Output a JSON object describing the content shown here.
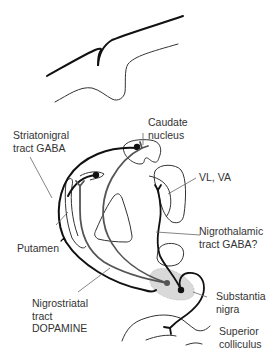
{
  "diagram": {
    "title": "",
    "colors": {
      "background": "#ffffff",
      "ink": "#111111",
      "outline": "#333333",
      "pointer": "#666666",
      "nigra_fill": "#d9d9d9",
      "label": "#333333"
    },
    "labels": {
      "caudate_line1": "Caudate",
      "caudate_line2": "nucleus",
      "striatonigral_line1": "Striatonigral",
      "striatonigral_line2": "tract GABA",
      "vl_va": "VL, VA",
      "putamen": "Putamen",
      "nigrothalamic_line1": "Nigrothalamic",
      "nigrothalamic_line2": "tract GABA?",
      "nigrostriatal_line1": "Nigrostriatal",
      "nigrostriatal_line2": "tract",
      "nigrostriatal_line3": "DOPAMINE",
      "substantia_line1": "Substantia",
      "substantia_line2": "nigra",
      "superior_line1": "Superior",
      "superior_line2": "colliculus"
    },
    "structures": [
      "cortex-surface",
      "caudate-nucleus",
      "putamen",
      "globus-pallidus",
      "thalamus-vl-va",
      "substantia-nigra",
      "superior-colliculus"
    ],
    "pathways": [
      {
        "name": "Striatonigral tract",
        "transmitter": "GABA"
      },
      {
        "name": "Nigrostriatal tract",
        "transmitter": "DOPAMINE"
      },
      {
        "name": "Nigrothalamic tract",
        "transmitter": "GABA?"
      }
    ]
  }
}
